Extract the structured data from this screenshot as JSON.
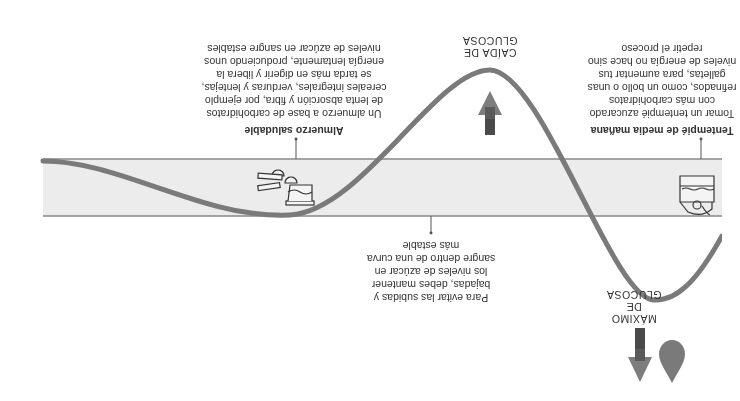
{
  "orientation": "rotated-180",
  "colors": {
    "band_fill": "#ececec",
    "band_line": "#8a8a8a",
    "curve": "#7a7a7a",
    "arrow": "#7d7d7d",
    "arrow_dark": "#4a4a4a",
    "drop": "#7a7a7a",
    "text": "#333333"
  },
  "labels": {
    "peak": {
      "line1": "MÁXIMO DE",
      "line2": "GLUCOSA"
    },
    "drop": {
      "line1": "CAÍDA DE",
      "line2": "GLUCOSA"
    }
  },
  "callouts": {
    "snack": {
      "title": "Tentempié de media mañana",
      "lines": [
        "Tomar un tentempié azucarado",
        "con más carbohidratos",
        "refinados, como un bollo o unas",
        "galletas, para aumentar tus",
        "niveles de energía no hace sino",
        "repetir el proceso"
      ]
    },
    "stable": {
      "lines": [
        "Para evitar las subidas y",
        "bajadas, debes mantener",
        "los niveles de azúcar en",
        "sangre dentro de una curva",
        "más estable"
      ]
    },
    "lunch": {
      "title": "Almuerzo saludable",
      "lines": [
        "Un almuerzo a base de carbohidratos",
        "de lenta absorción y fibra, por ejemplo",
        "cereales integrales, verduras y lentejas,",
        "se tarda más en digerir y libera la",
        "energía lentamente, produciendo unos",
        "niveles de azúcar en sangre estables"
      ]
    }
  },
  "icons": {
    "drop": "blood-drop-icon",
    "down_arrow": "arrow-down-icon",
    "up_arrow": "arrow-up-icon",
    "snack": "pastry-snack-icon",
    "lunch": "healthy-lunch-icon"
  }
}
